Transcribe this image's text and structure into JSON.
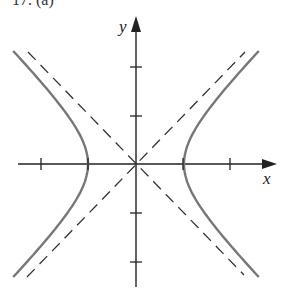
{
  "figure": {
    "partial_label": "17. (a)",
    "x_axis_label": "x",
    "y_axis_label": "y",
    "equation": "x^2 - y^2 = 1",
    "asymptotes": [
      "y = x",
      "y = -x"
    ],
    "vertices": [
      [
        -1,
        0
      ],
      [
        1,
        0
      ]
    ],
    "x_ticks": [
      -2,
      -1,
      1,
      2
    ],
    "y_ticks": [
      -2,
      -1,
      1,
      2
    ],
    "colors": {
      "curve": "#777777",
      "axes": "#222222",
      "asymptote": "#333333"
    }
  }
}
